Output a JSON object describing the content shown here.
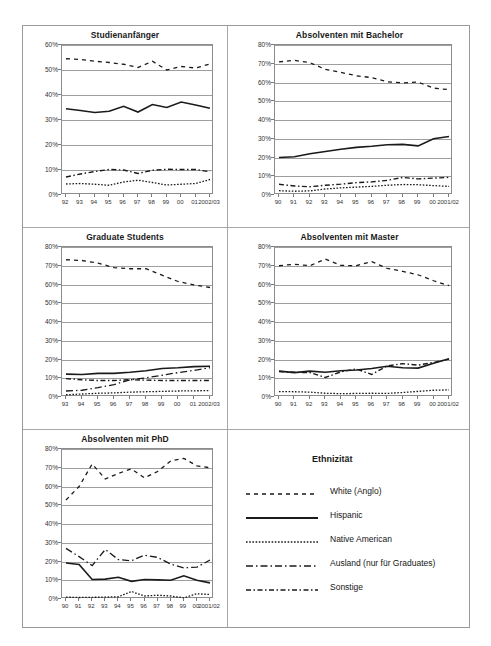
{
  "legend": {
    "title": "Ethnizität",
    "items": [
      {
        "label": "White (Anglo)",
        "style": "sparse-dash",
        "dash": "4,4",
        "width": 1.3
      },
      {
        "label": "Hispanic",
        "style": "solid",
        "dash": "",
        "width": 1.6
      },
      {
        "label": "Native American",
        "style": "fine-dot",
        "dash": "1.6,1.6",
        "width": 1.3
      },
      {
        "label": "Ausland (nur für Graduates)",
        "style": "long-dash-dot",
        "dash": "7,3,1.5,3",
        "width": 1.3
      },
      {
        "label": "Sonstige",
        "style": "dash-dot",
        "dash": "5,2.5,1.5,2.5",
        "width": 1.4
      }
    ]
  },
  "chart_data": [
    {
      "id": "studienanfaenger",
      "type": "line",
      "title": "Studienanfänger",
      "xlabel": "",
      "ylabel": "",
      "ylim": [
        0,
        60
      ],
      "yticks": [
        0,
        10,
        20,
        30,
        40,
        50,
        60
      ],
      "ytick_labels": [
        "0%",
        "10%",
        "20%",
        "30%",
        "40%",
        "50%",
        "60%"
      ],
      "categories": [
        "92",
        "93",
        "94",
        "95",
        "96",
        "97",
        "98",
        "99",
        "00",
        "01",
        "2002/03"
      ],
      "grid": true,
      "series": [
        {
          "name": "White (Anglo)",
          "dash": "4,4",
          "width": 1.3,
          "values": [
            54.5,
            54.2,
            53.5,
            53.0,
            52.3,
            51.0,
            53.5,
            50.0,
            51.4,
            50.8,
            52.4
          ]
        },
        {
          "name": "Hispanic",
          "dash": "",
          "width": 1.6,
          "values": [
            34.5,
            33.8,
            33.0,
            33.5,
            35.5,
            33.2,
            36.2,
            35.0,
            37.2,
            36.0,
            34.7
          ]
        },
        {
          "name": "Native American",
          "dash": "1.6,1.6",
          "width": 1.3,
          "values": [
            4.4,
            4.6,
            4.3,
            3.9,
            5.2,
            5.9,
            5.0,
            4.0,
            4.3,
            4.6,
            6.2
          ]
        },
        {
          "name": "Sonstige",
          "dash": "5,2.5,1.5,2.5",
          "width": 1.4,
          "values": [
            7.2,
            8.4,
            9.4,
            10.2,
            10.0,
            8.6,
            9.9,
            10.3,
            10.2,
            10.2,
            9.3
          ]
        }
      ]
    },
    {
      "id": "bachelor",
      "type": "line",
      "title": "Absolventen mit Bachelor",
      "xlabel": "",
      "ylabel": "",
      "ylim": [
        0,
        80
      ],
      "yticks": [
        0,
        10,
        20,
        30,
        40,
        50,
        60,
        70,
        80
      ],
      "ytick_labels": [
        "0%",
        "10%",
        "20%",
        "30%",
        "40%",
        "50%",
        "60%",
        "70%",
        "80%"
      ],
      "categories": [
        "90",
        "91",
        "92",
        "93",
        "94",
        "95",
        "96",
        "97",
        "98",
        "99",
        "00",
        "2001/02"
      ],
      "grid": true,
      "series": [
        {
          "name": "White (Anglo)",
          "dash": "4,4",
          "width": 1.3,
          "values": [
            71.0,
            71.8,
            70.6,
            67.0,
            65.4,
            63.6,
            62.6,
            60.4,
            59.8,
            60.2,
            57.0,
            56.2
          ]
        },
        {
          "name": "Hispanic",
          "dash": "",
          "width": 1.6,
          "values": [
            20.0,
            20.4,
            22.0,
            23.2,
            24.4,
            25.4,
            26.0,
            26.8,
            27.0,
            26.2,
            30.0,
            31.2
          ]
        },
        {
          "name": "Native American",
          "dash": "1.6,1.6",
          "width": 1.3,
          "values": [
            2.3,
            2.0,
            2.2,
            3.2,
            3.8,
            4.2,
            4.6,
            5.2,
            5.6,
            5.5,
            5.0,
            4.6
          ]
        },
        {
          "name": "Sonstige",
          "dash": "5,2.5,1.5,2.5",
          "width": 1.4,
          "values": [
            5.7,
            4.8,
            4.4,
            5.2,
            5.8,
            6.6,
            7.0,
            7.8,
            9.4,
            8.6,
            9.0,
            9.4
          ]
        }
      ]
    },
    {
      "id": "graduate",
      "type": "line",
      "title": "Graduate Students",
      "xlabel": "",
      "ylabel": "",
      "ylim": [
        0,
        80
      ],
      "yticks": [
        0,
        10,
        20,
        30,
        40,
        50,
        60,
        70,
        80
      ],
      "ytick_labels": [
        "0%",
        "10%",
        "20%",
        "30%",
        "40%",
        "50%",
        "60%",
        "70%",
        "80%"
      ],
      "categories": [
        "93",
        "94",
        "95",
        "96",
        "97",
        "98",
        "99",
        "00",
        "01",
        "2002/03"
      ],
      "grid": true,
      "series": [
        {
          "name": "White (Anglo)",
          "dash": "4,4",
          "width": 1.3,
          "values": [
            73.2,
            72.8,
            71.4,
            69.0,
            68.4,
            68.4,
            65.0,
            61.6,
            59.8,
            58.4
          ]
        },
        {
          "name": "Hispanic",
          "dash": "",
          "width": 1.6,
          "values": [
            12.2,
            12.0,
            12.6,
            12.6,
            13.2,
            14.0,
            15.2,
            15.6,
            16.2,
            16.4
          ]
        },
        {
          "name": "Native American",
          "dash": "1.6,1.6",
          "width": 1.3,
          "values": [
            1.2,
            1.6,
            2.0,
            2.2,
            2.6,
            2.8,
            3.0,
            3.2,
            3.3,
            3.4
          ]
        },
        {
          "name": "Ausland (nur für Graduates)",
          "dash": "7,3,1.5,3",
          "width": 1.3,
          "values": [
            3.2,
            3.6,
            5.0,
            6.6,
            9.2,
            10.2,
            11.6,
            13.0,
            14.2,
            15.6
          ]
        },
        {
          "name": "Sonstige",
          "dash": "5,2.5,1.5,2.5",
          "width": 1.4,
          "values": [
            9.8,
            9.2,
            8.8,
            8.8,
            9.2,
            9.0,
            8.8,
            8.8,
            8.8,
            8.8
          ]
        }
      ]
    },
    {
      "id": "master",
      "type": "line",
      "title": "Absolventen mit Master",
      "xlabel": "",
      "ylabel": "",
      "ylim": [
        0,
        80
      ],
      "yticks": [
        0,
        10,
        20,
        30,
        40,
        50,
        60,
        70,
        80
      ],
      "ytick_labels": [
        "0%",
        "10%",
        "20%",
        "30%",
        "40%",
        "50%",
        "60%",
        "70%",
        "80%"
      ],
      "categories": [
        "90",
        "91",
        "92",
        "93",
        "94",
        "95",
        "96",
        "97",
        "98",
        "99",
        "00",
        "2001/02"
      ],
      "grid": true,
      "series": [
        {
          "name": "White (Anglo)",
          "dash": "4,4",
          "width": 1.3,
          "values": [
            70.0,
            70.8,
            70.0,
            73.6,
            70.2,
            70.0,
            72.2,
            68.6,
            67.0,
            65.2,
            62.0,
            59.4
          ]
        },
        {
          "name": "Hispanic",
          "dash": "",
          "width": 1.6,
          "values": [
            13.8,
            13.0,
            13.8,
            13.2,
            14.0,
            14.4,
            15.2,
            16.4,
            15.6,
            15.4,
            18.0,
            20.4
          ]
        },
        {
          "name": "Native American",
          "dash": "1.6,1.6",
          "width": 1.3,
          "values": [
            2.9,
            2.8,
            2.6,
            2.0,
            1.8,
            1.9,
            2.0,
            1.9,
            2.4,
            3.0,
            3.6,
            3.8
          ]
        },
        {
          "name": "Sonstige",
          "dash": "5,2.5,1.5,2.5",
          "width": 1.4,
          "values": [
            13.6,
            13.2,
            13.0,
            10.4,
            13.4,
            15.0,
            12.0,
            16.6,
            17.8,
            17.0,
            18.4,
            20.2
          ]
        }
      ]
    },
    {
      "id": "phd",
      "type": "line",
      "title": "Absolventen mit PhD",
      "xlabel": "",
      "ylabel": "",
      "ylim": [
        0,
        80
      ],
      "yticks": [
        0,
        10,
        20,
        30,
        40,
        50,
        60,
        70,
        80
      ],
      "ytick_labels": [
        "0%",
        "10%",
        "20%",
        "30%",
        "40%",
        "50%",
        "60%",
        "70%",
        "80%"
      ],
      "categories": [
        "90",
        "91",
        "92",
        "93",
        "94",
        "95",
        "96",
        "97",
        "98",
        "99",
        "00",
        "2001/02"
      ],
      "grid": true,
      "series": [
        {
          "name": "White (Anglo)",
          "dash": "4,4",
          "width": 1.3,
          "values": [
            52.8,
            60.0,
            72.0,
            64.0,
            67.0,
            69.4,
            64.6,
            68.0,
            73.6,
            75.0,
            71.0,
            70.0
          ]
        },
        {
          "name": "Hispanic",
          "dash": "",
          "width": 1.6,
          "values": [
            19.2,
            18.4,
            10.4,
            10.6,
            11.6,
            9.4,
            10.4,
            10.2,
            10.0,
            12.4,
            10.0,
            8.6
          ]
        },
        {
          "name": "Native American",
          "dash": "1.6,1.6",
          "width": 1.3,
          "values": [
            1.0,
            0.8,
            0.9,
            1.0,
            1.2,
            4.0,
            1.6,
            2.0,
            1.6,
            0.6,
            2.8,
            2.4
          ]
        },
        {
          "name": "Ausland (nur für Graduates)",
          "dash": "7,3,1.5,3",
          "width": 1.3,
          "values": [
            27.0,
            22.6,
            17.8,
            26.4,
            21.0,
            20.4,
            23.4,
            22.2,
            18.6,
            16.6,
            17.0,
            20.8
          ]
        }
      ]
    }
  ]
}
